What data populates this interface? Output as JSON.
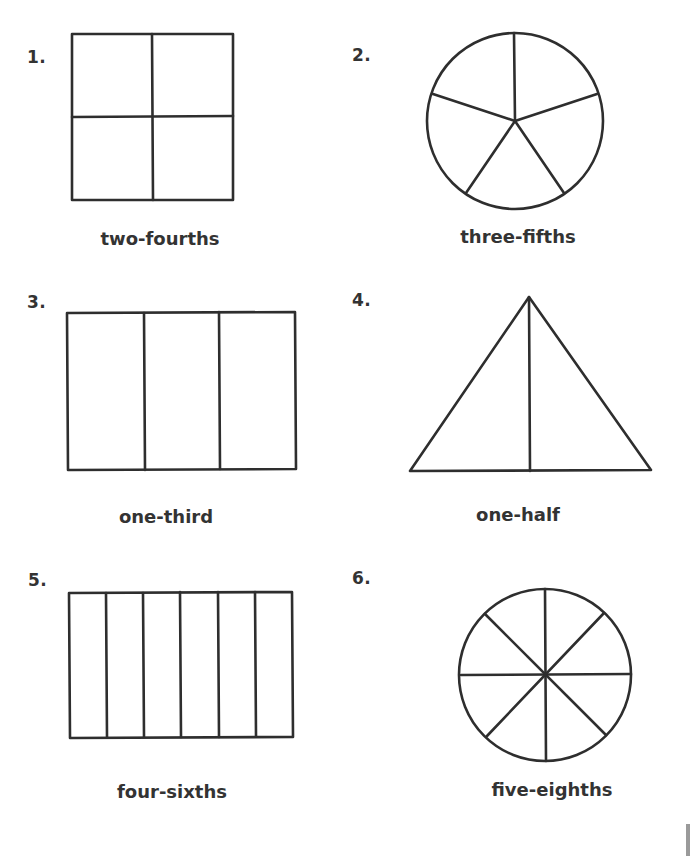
{
  "worksheet": {
    "items": [
      {
        "number": "1.",
        "shape": "square",
        "parts": 4,
        "caption": "two-fourths"
      },
      {
        "number": "2.",
        "shape": "circle",
        "parts": 5,
        "caption": "three-fifths"
      },
      {
        "number": "3.",
        "shape": "rectangle",
        "parts": 3,
        "caption": "one-third"
      },
      {
        "number": "4.",
        "shape": "triangle",
        "parts": 2,
        "caption": "one-half"
      },
      {
        "number": "5.",
        "shape": "rectangle",
        "parts": 6,
        "caption": "four-sixths"
      },
      {
        "number": "6.",
        "shape": "circle",
        "parts": 8,
        "caption": "five-eighths"
      }
    ]
  },
  "colors": {
    "line": "#2e2e2e",
    "text": "#333333",
    "background": "#ffffff"
  }
}
